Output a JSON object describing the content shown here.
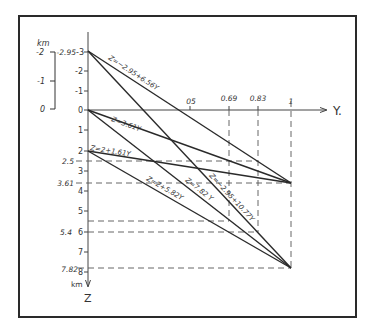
{
  "diagram": {
    "axes": {
      "x_label": "Y.",
      "z_label": "Z",
      "z_unit": "km",
      "z_ticks": [
        "-3",
        "-2",
        "-1",
        "0",
        "1",
        "2",
        "3",
        "4",
        "5",
        "6",
        "7",
        "8"
      ],
      "y_ticks": [
        "05",
        "0.69",
        "0.83",
        "1"
      ]
    },
    "scale_bar": {
      "unit": "km",
      "labels": [
        "-2",
        "-1",
        "0"
      ]
    },
    "marked_values": {
      "z_top": "-2.95",
      "z_2_5": "2.5",
      "z_3_61": "3.61",
      "z_5_4": "5.4",
      "z_7_82": "7.82"
    },
    "lines": [
      {
        "label": "Z=-2.95+6.56Y",
        "display": "Z=−2.95+6.56Y"
      },
      {
        "label": "Z=3.61Y",
        "display": "Z=3.61Y"
      },
      {
        "label": "Z=2+1.61Y",
        "display": "Z=2+1.61Y"
      },
      {
        "label": "Z=2+5.82Y",
        "display": "Z=2+5.82Y"
      },
      {
        "label": "Z=7.82Y",
        "display": "Z=7.82 Y"
      },
      {
        "label": "Z=-2.95+10.77Y",
        "display": "Z=−2.95+10.77Y"
      }
    ]
  }
}
